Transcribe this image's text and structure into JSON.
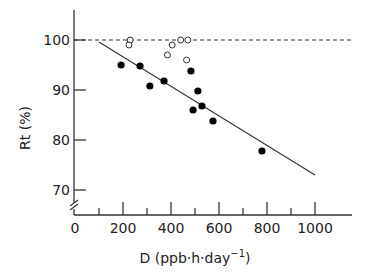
{
  "chart_data": {
    "type": "scatter",
    "title": "",
    "xlabel": "D (ppb·h·day⁻¹)",
    "xlabel_main": "D  (ppb·h·day",
    "xlabel_sup": "−1",
    "xlabel_close": ")",
    "ylabel": "Rt (%)",
    "xlim": [
      0,
      1150
    ],
    "ylim": [
      65,
      105
    ],
    "y_axis_break": true,
    "grid": false,
    "x_ticks": [
      0,
      200,
      400,
      600,
      800,
      1000
    ],
    "x_tick_labels": [
      "0",
      "200",
      "400",
      "600",
      "800",
      "1000"
    ],
    "x_minor_ticks": [
      100,
      300,
      500,
      700,
      900
    ],
    "y_ticks": [
      70,
      80,
      90,
      100
    ],
    "y_tick_labels": [
      "70",
      "80",
      "90",
      "100"
    ],
    "reference_line": {
      "style": "dashed",
      "y": 100,
      "x_range": [
        0,
        1150
      ]
    },
    "regression_line": {
      "style": "solid",
      "x": [
        100,
        1000
      ],
      "y": [
        99.6,
        73.0
      ]
    },
    "series": [
      {
        "name": "open circles",
        "marker": "open-circle",
        "points": [
          {
            "x": 230,
            "y": 100.0
          },
          {
            "x": 225,
            "y": 99.0
          },
          {
            "x": 385,
            "y": 97.0
          },
          {
            "x": 405,
            "y": 99.0
          },
          {
            "x": 440,
            "y": 100.0
          },
          {
            "x": 470,
            "y": 100.0
          },
          {
            "x": 465,
            "y": 96.0
          }
        ]
      },
      {
        "name": "filled circles",
        "marker": "filled-circle",
        "points": [
          {
            "x": 192,
            "y": 95.0
          },
          {
            "x": 271,
            "y": 94.8
          },
          {
            "x": 312,
            "y": 90.8
          },
          {
            "x": 371,
            "y": 91.8
          },
          {
            "x": 483,
            "y": 93.8
          },
          {
            "x": 512,
            "y": 89.8
          },
          {
            "x": 492,
            "y": 86.0
          },
          {
            "x": 529,
            "y": 86.8
          },
          {
            "x": 575,
            "y": 83.8
          },
          {
            "x": 779,
            "y": 77.8
          }
        ]
      }
    ]
  }
}
